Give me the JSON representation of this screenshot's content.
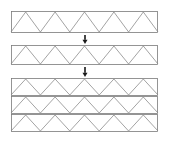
{
  "figure": {
    "title": "",
    "background_color": "#ffffff",
    "width": 170,
    "height": 141,
    "chord_color": "#7a7a7a",
    "web_color": "#8c8c8c",
    "arrow_color": "#1a1a1a",
    "stroke_width": 0.8
  },
  "chart_data": {
    "type": "diagram",
    "stages": [
      {
        "id": "stage-1",
        "label": "single truss",
        "panels": 1,
        "x": 11,
        "y": 11,
        "width": 147,
        "height": 22,
        "zigzag_peaks": 5,
        "zigzag_start": "bottom"
      },
      {
        "id": "stage-2",
        "label": "single truss",
        "panels": 1,
        "x": 11,
        "y": 45,
        "width": 147,
        "height": 20,
        "zigzag_peaks": 5,
        "zigzag_start": "bottom"
      },
      {
        "id": "stage-3",
        "label": "stacked truss assembly",
        "panels": 3,
        "x": 11,
        "y": 78,
        "width": 147,
        "height": 54,
        "rows": [
          {
            "y": 78,
            "height": 18,
            "zigzag_peaks": 5,
            "zigzag_start": "bottom"
          },
          {
            "y": 96,
            "height": 18,
            "zigzag_peaks": 5,
            "zigzag_start": "bottom"
          },
          {
            "y": 114,
            "height": 18,
            "zigzag_peaks": 5,
            "zigzag_start": "bottom"
          }
        ]
      }
    ],
    "arrows": [
      {
        "id": "arrow-1",
        "x": 85,
        "y_top": 35,
        "y_bottom": 44,
        "direction": "down"
      },
      {
        "id": "arrow-2",
        "x": 85,
        "y_top": 67,
        "y_bottom": 77,
        "direction": "down"
      }
    ]
  }
}
